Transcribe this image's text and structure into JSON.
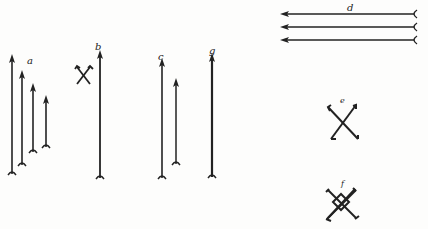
{
  "figure": {
    "labels": {
      "a": "a",
      "b": "b",
      "c": "c",
      "g": "g",
      "d": "d",
      "e": "e",
      "f": "f"
    },
    "ink_color": "#222222",
    "background": "#fdfdfc"
  }
}
